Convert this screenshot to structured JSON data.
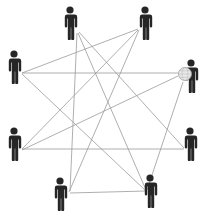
{
  "diagram": {
    "colors": {
      "background": "#ffffff",
      "person": "#262626",
      "edge": "#9a9a9a",
      "globe": "#e9e9e9"
    },
    "nodes": [
      {
        "id": "p1",
        "x": 70,
        "y": 6,
        "icon": "person-icon"
      },
      {
        "id": "p2",
        "x": 145,
        "y": 6,
        "icon": "person-icon"
      },
      {
        "id": "p3",
        "x": 14,
        "y": 50,
        "icon": "person-icon"
      },
      {
        "id": "p4",
        "x": 191,
        "y": 59,
        "icon": "person-with-globe-icon"
      },
      {
        "id": "p5",
        "x": 14,
        "y": 127,
        "icon": "person-icon"
      },
      {
        "id": "p6",
        "x": 190,
        "y": 127,
        "icon": "person-icon"
      },
      {
        "id": "p7",
        "x": 60,
        "y": 177,
        "icon": "person-icon"
      },
      {
        "id": "p8",
        "x": 150,
        "y": 174,
        "icon": "person-icon"
      }
    ],
    "edges": [
      {
        "from": "p1",
        "to": "p7",
        "x1": 77,
        "y1": 33,
        "x2": 70,
        "y2": 191
      },
      {
        "from": "p1",
        "to": "p8",
        "x1": 78,
        "y1": 33,
        "x2": 146,
        "y2": 190
      },
      {
        "from": "p1",
        "to": "p6",
        "x1": 79,
        "y1": 32,
        "x2": 184,
        "y2": 148
      },
      {
        "from": "p2",
        "to": "p3",
        "x1": 138,
        "y1": 29,
        "x2": 22,
        "y2": 73
      },
      {
        "from": "p2",
        "to": "p5",
        "x1": 138,
        "y1": 30,
        "x2": 22,
        "y2": 149
      },
      {
        "from": "p2",
        "to": "p7",
        "x1": 139,
        "y1": 30,
        "x2": 69,
        "y2": 192
      },
      {
        "from": "p3",
        "to": "p4",
        "x1": 22,
        "y1": 73,
        "x2": 178,
        "y2": 73
      },
      {
        "from": "p3",
        "to": "p8",
        "x1": 22,
        "y1": 74,
        "x2": 146,
        "y2": 191
      },
      {
        "from": "p4",
        "to": "p5",
        "x1": 178,
        "y1": 76,
        "x2": 22,
        "y2": 150
      },
      {
        "from": "p4",
        "to": "p8",
        "x1": 183,
        "y1": 82,
        "x2": 147,
        "y2": 190
      },
      {
        "from": "p5",
        "to": "p6",
        "x1": 22,
        "y1": 149,
        "x2": 184,
        "y2": 149
      },
      {
        "from": "p7",
        "to": "p8",
        "x1": 70,
        "y1": 193,
        "x2": 146,
        "y2": 191
      }
    ]
  }
}
